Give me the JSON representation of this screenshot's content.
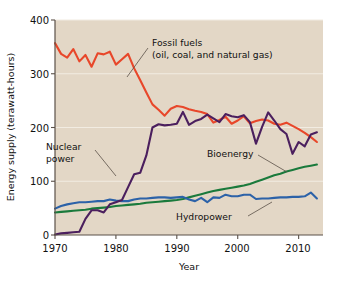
{
  "chart_data": {
    "type": "line",
    "title": "",
    "xlabel": "Year",
    "ylabel": "Energy supply (terawatt-hours)",
    "xlim": [
      1970,
      2014
    ],
    "ylim": [
      0,
      400
    ],
    "yticks": [
      0,
      100,
      200,
      300,
      400
    ],
    "xticks": [
      1970,
      1980,
      1990,
      2000,
      2010
    ],
    "grid": "horizontal",
    "legend_position": "inline-annotations",
    "plot_background": "#e3d7c6",
    "x": [
      1970,
      1971,
      1972,
      1973,
      1974,
      1975,
      1976,
      1977,
      1978,
      1979,
      1980,
      1981,
      1982,
      1983,
      1984,
      1985,
      1986,
      1987,
      1988,
      1989,
      1990,
      1991,
      1992,
      1993,
      1994,
      1995,
      1996,
      1997,
      1998,
      1999,
      2000,
      2001,
      2002,
      2003,
      2004,
      2005,
      2006,
      2007,
      2008,
      2009,
      2010,
      2011,
      2012,
      2013
    ],
    "series": [
      {
        "name": "Fossil fuels (oil, coal, and natural gas)",
        "color": "#e8472a",
        "values": [
          357,
          337,
          330,
          346,
          323,
          335,
          313,
          338,
          336,
          341,
          317,
          327,
          337,
          310,
          288,
          265,
          243,
          233,
          222,
          235,
          240,
          238,
          234,
          231,
          229,
          225,
          209,
          214,
          220,
          207,
          213,
          221,
          208,
          212,
          215,
          213,
          207,
          205,
          209,
          203,
          197,
          190,
          182,
          173
        ]
      },
      {
        "name": "Nuclear power",
        "color": "#4b1f5e",
        "values": [
          1,
          3,
          4,
          5,
          6,
          30,
          46,
          46,
          42,
          57,
          61,
          65,
          89,
          113,
          116,
          148,
          200,
          206,
          204,
          205,
          207,
          229,
          205,
          212,
          216,
          224,
          217,
          210,
          225,
          221,
          219,
          223,
          210,
          170,
          201,
          228,
          213,
          197,
          188,
          151,
          173,
          165,
          187,
          191
        ]
      },
      {
        "name": "Bioenergy",
        "color": "#1a7a3c",
        "values": [
          42,
          43,
          44,
          45,
          46,
          47,
          49,
          50,
          51,
          52,
          54,
          55,
          56,
          57,
          58,
          60,
          61,
          62,
          63,
          64,
          65,
          67,
          70,
          73,
          76,
          79,
          82,
          84,
          86,
          88,
          90,
          92,
          95,
          99,
          103,
          107,
          111,
          114,
          118,
          121,
          124,
          127,
          129,
          131
        ]
      },
      {
        "name": "Hydropower",
        "color": "#2c62a8",
        "values": [
          49,
          54,
          57,
          59,
          61,
          61,
          62,
          63,
          63,
          66,
          64,
          63,
          63,
          66,
          68,
          68,
          69,
          70,
          70,
          69,
          70,
          71,
          66,
          63,
          69,
          61,
          70,
          69,
          75,
          72,
          72,
          75,
          75,
          67,
          68,
          68,
          69,
          70,
          70,
          71,
          71,
          72,
          79,
          68
        ]
      }
    ],
    "annotations": [
      {
        "label_line1": "Fossil fuels",
        "label_line2": "(oil, coal, and natural gas)"
      },
      {
        "label_line1": "Nuclear",
        "label_line2": "power"
      },
      {
        "label_line1": "Bioenergy",
        "label_line2": ""
      },
      {
        "label_line1": "Hydropower",
        "label_line2": ""
      }
    ]
  },
  "labels": {
    "y_axis_title": "Energy supply (terawatt-hours)",
    "x_axis_title": "Year",
    "ytick_0": "0",
    "ytick_100": "100",
    "ytick_200": "200",
    "ytick_300": "300",
    "ytick_400": "400",
    "xtick_1970": "1970",
    "xtick_1980": "1980",
    "xtick_1990": "1990",
    "xtick_2000": "2000",
    "xtick_2010": "2010",
    "annot_fossil_1": "Fossil fuels",
    "annot_fossil_2": "(oil, coal, and natural gas)",
    "annot_nuclear_1": "Nuclear",
    "annot_nuclear_2": "power",
    "annot_bioenergy": "Bioenergy",
    "annot_hydropower": "Hydropower"
  }
}
